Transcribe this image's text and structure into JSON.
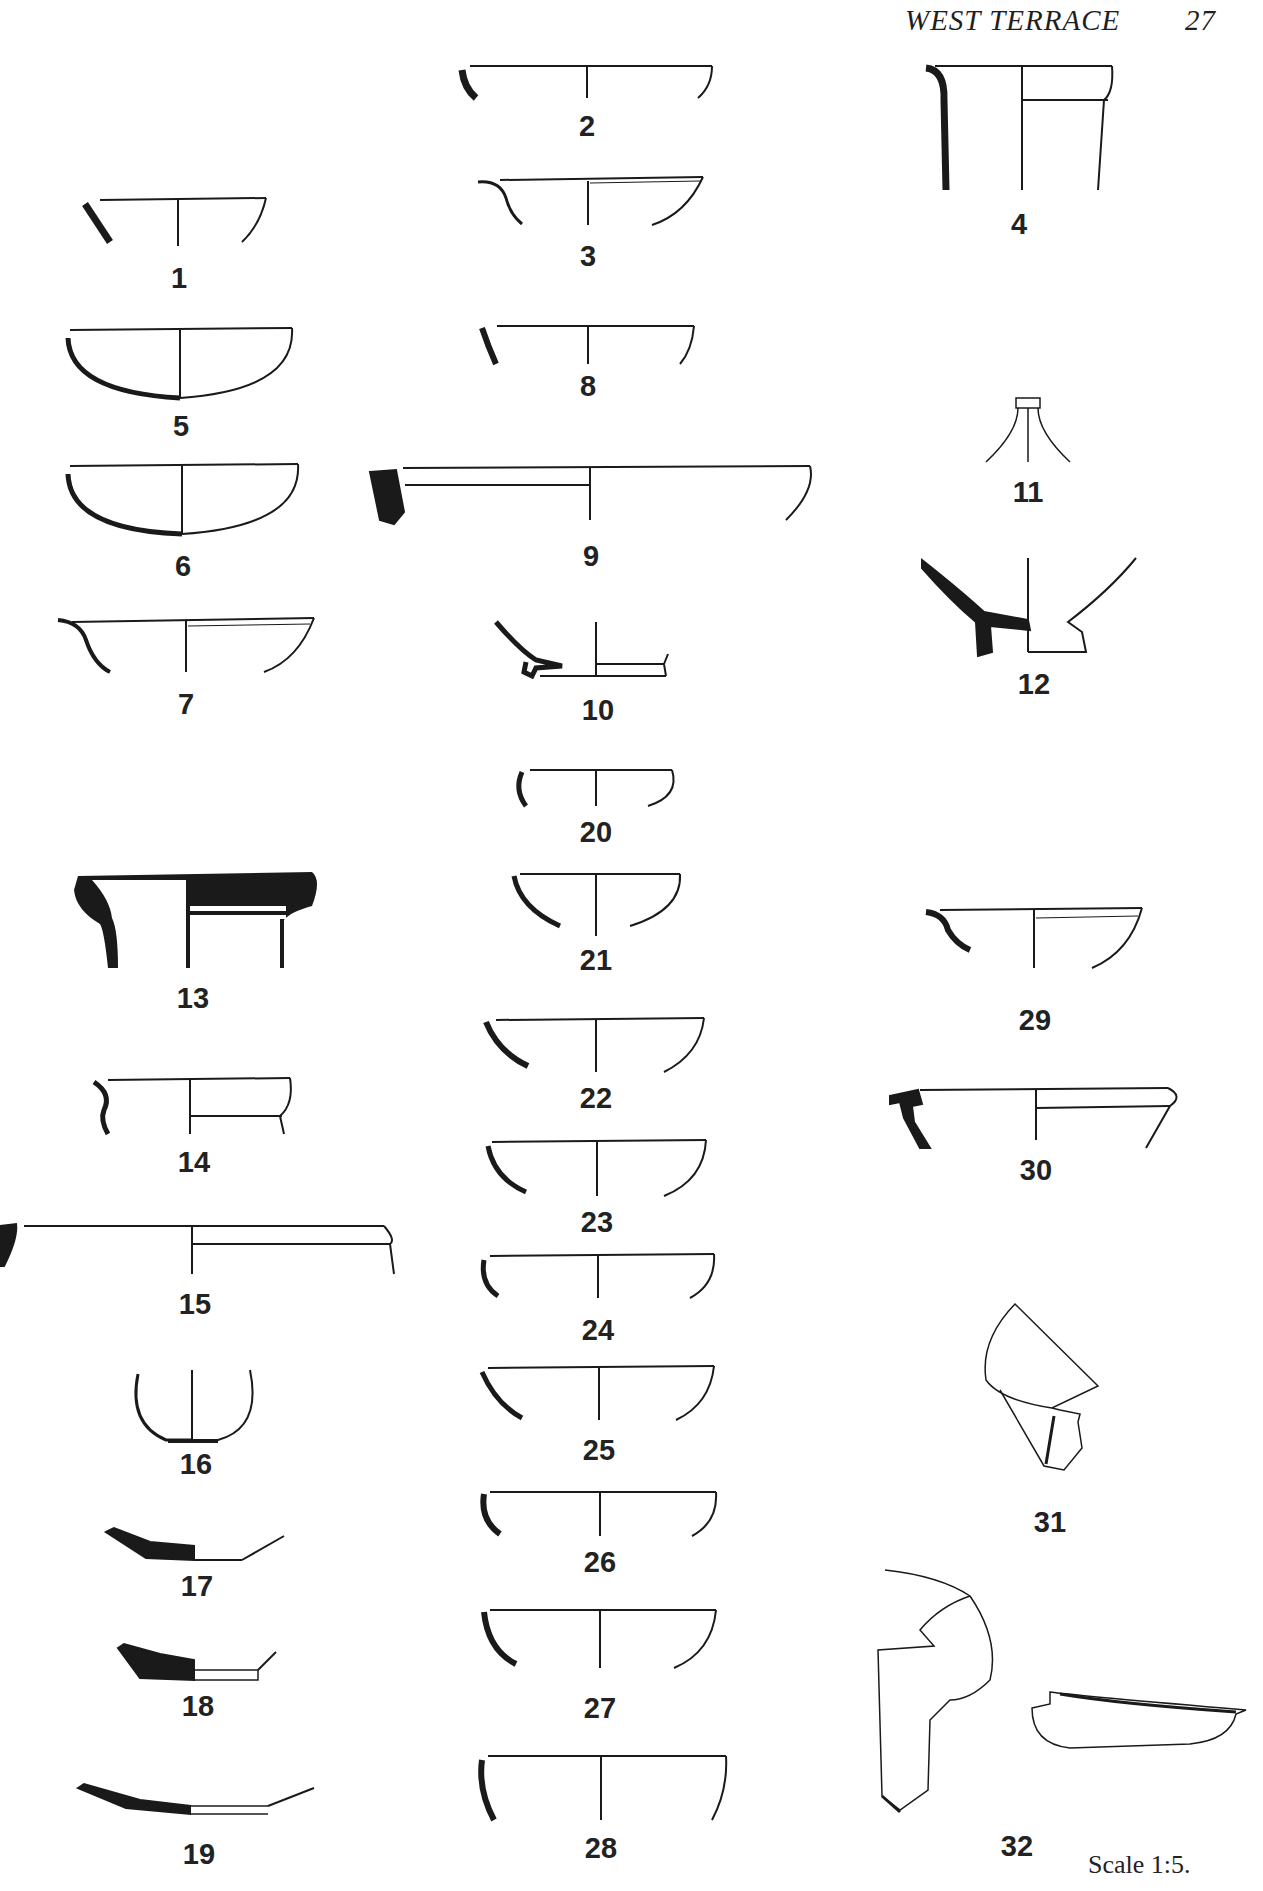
{
  "header": {
    "title": "WEST TERRACE",
    "page_number": "27"
  },
  "figures": [
    {
      "id": "1",
      "x": 179,
      "y": 262
    },
    {
      "id": "2",
      "x": 587,
      "y": 110
    },
    {
      "id": "3",
      "x": 588,
      "y": 240
    },
    {
      "id": "4",
      "x": 1019,
      "y": 208
    },
    {
      "id": "5",
      "x": 181,
      "y": 410
    },
    {
      "id": "6",
      "x": 183,
      "y": 550
    },
    {
      "id": "7",
      "x": 186,
      "y": 688
    },
    {
      "id": "8",
      "x": 588,
      "y": 370
    },
    {
      "id": "9",
      "x": 591,
      "y": 540
    },
    {
      "id": "10",
      "x": 598,
      "y": 694
    },
    {
      "id": "11",
      "x": 1028,
      "y": 476
    },
    {
      "id": "12",
      "x": 1034,
      "y": 668
    },
    {
      "id": "13",
      "x": 193,
      "y": 982
    },
    {
      "id": "14",
      "x": 194,
      "y": 1146
    },
    {
      "id": "15",
      "x": 195,
      "y": 1288
    },
    {
      "id": "16",
      "x": 196,
      "y": 1448
    },
    {
      "id": "17",
      "x": 197,
      "y": 1570
    },
    {
      "id": "18",
      "x": 198,
      "y": 1690
    },
    {
      "id": "19",
      "x": 199,
      "y": 1838
    },
    {
      "id": "20",
      "x": 596,
      "y": 816
    },
    {
      "id": "21",
      "x": 596,
      "y": 944
    },
    {
      "id": "22",
      "x": 596,
      "y": 1082
    },
    {
      "id": "23",
      "x": 597,
      "y": 1206
    },
    {
      "id": "24",
      "x": 598,
      "y": 1314
    },
    {
      "id": "25",
      "x": 599,
      "y": 1434
    },
    {
      "id": "26",
      "x": 600,
      "y": 1546
    },
    {
      "id": "27",
      "x": 600,
      "y": 1692
    },
    {
      "id": "28",
      "x": 601,
      "y": 1832
    },
    {
      "id": "29",
      "x": 1035,
      "y": 1004
    },
    {
      "id": "30",
      "x": 1036,
      "y": 1154
    },
    {
      "id": "31",
      "x": 1050,
      "y": 1506
    },
    {
      "id": "32",
      "x": 1017,
      "y": 1830
    }
  ],
  "footer": {
    "scale_note": "Scale 1:5."
  }
}
